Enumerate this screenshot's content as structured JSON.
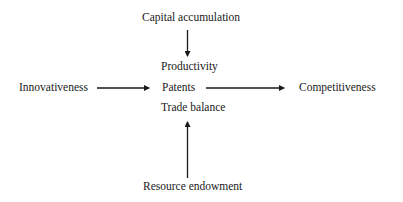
{
  "diagram": {
    "type": "flow",
    "nodes": {
      "capital_accumulation": "Capital accumulation",
      "innovativeness": "Innovativeness",
      "center": {
        "productivity": "Productivity",
        "patents": "Patents",
        "trade_balance": "Trade balance"
      },
      "competitiveness": "Competitiveness",
      "resource_endowment": "Resource endowment"
    },
    "edges": [
      {
        "from": "Capital accumulation",
        "to": "Productivity / Patents / Trade balance",
        "direction": "down"
      },
      {
        "from": "Innovativeness",
        "to": "Productivity / Patents / Trade balance",
        "direction": "right"
      },
      {
        "from": "Productivity / Patents / Trade balance",
        "to": "Competitiveness",
        "direction": "right"
      },
      {
        "from": "Resource endowment",
        "to": "Productivity / Patents / Trade balance",
        "direction": "up"
      }
    ],
    "colors": {
      "background": "#ffffff",
      "text": "#1a1a1a",
      "arrow": "#1a1a1a"
    }
  }
}
